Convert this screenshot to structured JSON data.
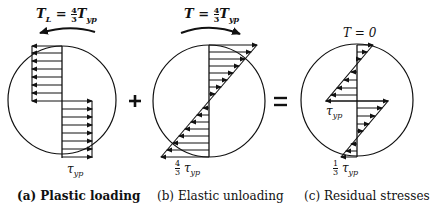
{
  "panels": [
    {
      "id": "a",
      "title": "T",
      "title_sub": "L",
      "title_eq": " = ",
      "title_frac_num": "4",
      "title_frac_den": "3",
      "title_rhs": "T",
      "title_rhs_sub": "yp",
      "bottom_label": "τ",
      "bottom_label_sub": "yp",
      "caption_prefix": "(a)",
      "caption": "Plastic loading"
    },
    {
      "id": "b",
      "title": "T",
      "title_eq": " = ",
      "title_frac_num": "4",
      "title_frac_den": "3",
      "title_rhs": "T",
      "title_rhs_sub": "yp",
      "bottom_frac_num": "4",
      "bottom_frac_den": "3",
      "bottom_label": "τ",
      "bottom_label_sub": "yp",
      "caption_prefix": "(b)",
      "caption": "Elastic unloading"
    },
    {
      "id": "c",
      "title": "T = 0",
      "mid_label": "τ",
      "mid_label_sub": "yp",
      "bottom_frac_num": "1",
      "bottom_frac_den": "3",
      "bottom_label": "τ",
      "bottom_label_sub": "yp",
      "caption_prefix": "(c)",
      "caption": "Residual stresses"
    }
  ],
  "operators": {
    "plus": "+",
    "equals": "="
  },
  "colors": {
    "ink": "#111111",
    "background": "#ffffff"
  }
}
